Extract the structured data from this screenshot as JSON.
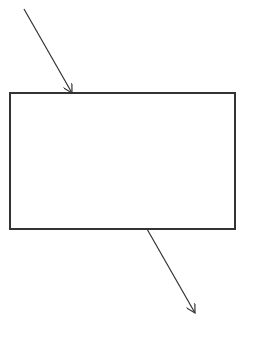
{
  "diagram": {
    "background": "#ffffff",
    "stroke_color": "#333333",
    "box": {
      "x": 10,
      "y": 93,
      "width": 225,
      "height": 136,
      "label": ""
    },
    "arrows": [
      {
        "name": "incoming-arrow",
        "x1": 24,
        "y1": 9,
        "x2": 72,
        "y2": 93
      },
      {
        "name": "outgoing-arrow",
        "x1": 147,
        "y1": 229,
        "x2": 195,
        "y2": 313
      }
    ]
  }
}
